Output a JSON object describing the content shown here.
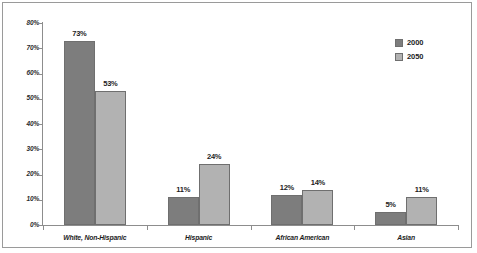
{
  "chart_data": {
    "type": "bar",
    "title": "",
    "subtitle": "",
    "xlabel": "",
    "ylabel": "",
    "ylim": [
      0,
      80
    ],
    "grid": false,
    "legend_position": "top-right",
    "categories": [
      "White, Non-Hispanic",
      "Hispanic",
      "African American",
      "Asian"
    ],
    "ytick_labels": [
      "80%",
      "70%",
      "60%",
      "50%",
      "40%",
      "30%",
      "20%",
      "10%",
      "0%"
    ],
    "ytick_values": [
      80,
      70,
      60,
      50,
      40,
      30,
      20,
      10,
      0
    ],
    "series": [
      {
        "name": "2000",
        "color": "#7d7d7d",
        "values": [
          73,
          11,
          12,
          5
        ],
        "value_labels": [
          "73%",
          "11%",
          "12%",
          "5%"
        ]
      },
      {
        "name": "2050",
        "color": "#b2b2b2",
        "values": [
          53,
          24,
          14,
          11
        ],
        "value_labels": [
          "53%",
          "24%",
          "14%",
          "11%"
        ]
      }
    ]
  },
  "legend": {
    "items": [
      {
        "label": "2000",
        "color": "#7d7d7d"
      },
      {
        "label": "2050",
        "color": "#b2b2b2"
      }
    ]
  },
  "colors": {
    "series_2000": "#7d7d7d",
    "series_2050": "#b2b2b2",
    "axis": "#8d8d8d",
    "frame": "#9a9a9a",
    "background": "#ffffff",
    "text": "#1d1d1d"
  }
}
